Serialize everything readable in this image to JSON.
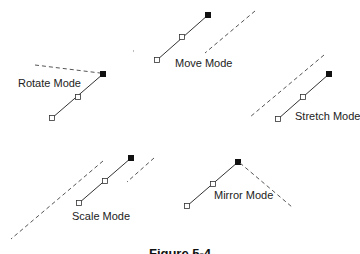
{
  "figure": {
    "caption": "Figure 5-4"
  },
  "modes": [
    {
      "id": "move",
      "label": "Move Mode"
    },
    {
      "id": "rotate",
      "label": "Rotate Mode"
    },
    {
      "id": "stretch",
      "label": "Stretch Mode"
    },
    {
      "id": "scale",
      "label": "Scale Mode"
    },
    {
      "id": "mirror",
      "label": "Mirror Mode"
    }
  ],
  "legend": {
    "filled_handle": "active-endpoint-handle",
    "open_handle": "endpoint-handle",
    "dashed_line": "preview-line"
  }
}
